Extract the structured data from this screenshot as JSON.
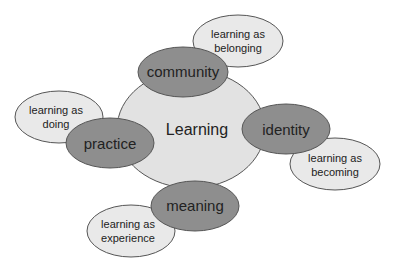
{
  "diagram": {
    "center": {
      "label": "Learning"
    },
    "components": [
      {
        "id": "community",
        "label": "community",
        "outcome": [
          "learning as",
          "belonging"
        ]
      },
      {
        "id": "practice",
        "label": "practice",
        "outcome": [
          "learning as",
          "doing"
        ]
      },
      {
        "id": "identity",
        "label": "identity",
        "outcome": [
          "learning as",
          "becoming"
        ]
      },
      {
        "id": "meaning",
        "label": "meaning",
        "outcome": [
          "learning as",
          "experience"
        ]
      }
    ]
  },
  "colors": {
    "center_fill": "#e2e2e2",
    "component_fill": "#8e8e8e",
    "outcome_fill": "#e9e9e9",
    "stroke": "#555555"
  }
}
